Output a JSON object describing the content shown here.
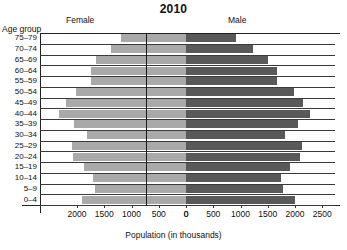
{
  "chart_data": {
    "type": "bar",
    "subtype": "population-pyramid",
    "title": "2010",
    "xlabel": "Population (in thousands)",
    "ylabel": "Age group",
    "categories": [
      "75–79",
      "70–74",
      "65–69",
      "60–64",
      "55–59",
      "50–54",
      "45–49",
      "40–44",
      "35–39",
      "30–34",
      "25–29",
      "20–24",
      "15–19",
      "10–14",
      "5–9",
      "0–4"
    ],
    "series": [
      {
        "name": "Female",
        "side": "left",
        "color": "#a9a9a9",
        "values": [
          1200,
          1375,
          1650,
          1750,
          1750,
          2025,
          2200,
          2325,
          2050,
          1825,
          2100,
          2075,
          1875,
          1700,
          1675,
          1900
        ]
      },
      {
        "name": "Male",
        "side": "right",
        "color": "#595959",
        "values": [
          925,
          1225,
          1500,
          1675,
          1675,
          1975,
          2150,
          2275,
          2050,
          1825,
          2125,
          2100,
          1900,
          1750,
          1775,
          2000
        ]
      }
    ],
    "xticks_left": [
      2000,
      1500,
      1000,
      500,
      0
    ],
    "xticks_right": [
      0,
      500,
      1000,
      1500,
      2000,
      2500
    ],
    "xlim_left": 2500,
    "xlim_right": 2500,
    "grid": false,
    "legend_position": "top-inline"
  },
  "header": {
    "title": "2010",
    "left_group_label": "Female",
    "right_group_label": "Male",
    "age_caption": "Age group"
  },
  "axis": {
    "x_title": "Population (in thousands)",
    "tick_labels": [
      "2000",
      "1500",
      "1000",
      "500",
      "0",
      "0",
      "500",
      "1000",
      "1500",
      "2000",
      "2500"
    ]
  }
}
